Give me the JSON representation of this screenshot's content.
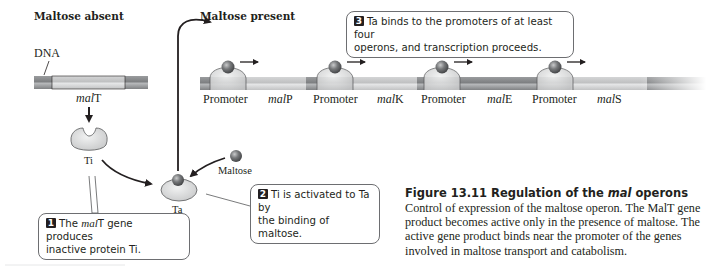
{
  "panels": {
    "left_title": "Maltose absent",
    "right_title": "Maltose present"
  },
  "labels": {
    "dna": "DNA",
    "malT_prefix": "mal",
    "malT_suffix": "T",
    "ti": "Ti",
    "ta": "Ta",
    "maltose": "Maltose"
  },
  "operon": {
    "promoter_label": "Promoter",
    "genes": [
      {
        "prefix": "mal",
        "suffix": "P"
      },
      {
        "prefix": "mal",
        "suffix": "K"
      },
      {
        "prefix": "mal",
        "suffix": "E"
      },
      {
        "prefix": "mal",
        "suffix": "S"
      }
    ]
  },
  "callouts": [
    {
      "number": "1",
      "text_a": "The ",
      "italic": "mal",
      "text_b": "T gene produces",
      "line2": "inactive protein Ti."
    },
    {
      "number": "2",
      "line1": "Ti is activated to Ta by",
      "line2": "the binding of maltose."
    },
    {
      "number": "3",
      "line1": "Ta binds to the promoters of at least four",
      "line2": "operons, and transcription proceeds."
    }
  ],
  "caption": {
    "title_prefix": "Figure 13.11  Regulation of the ",
    "title_italic": "mal",
    "title_suffix": " operons",
    "body": "Control of expression of the maltose operon. The MalT gene product becomes active only in the presence of maltose. The active gene product binds near the promoter of the genes involved in maltose transport and catabolism."
  },
  "colors": {
    "dna_dark": "#8a8c8e",
    "dna_light": "#c8c9ca",
    "protein_fill": "#d9dadb",
    "maltose_ball": "#6d6e71",
    "ink": "#231f20"
  }
}
